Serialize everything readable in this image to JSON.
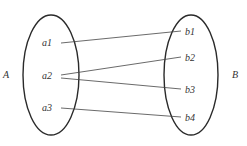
{
  "diagram": {
    "type": "mapping",
    "sets": [
      {
        "name": "A",
        "elements": [
          "a1",
          "a2",
          "a3"
        ]
      },
      {
        "name": "B",
        "elements": [
          "b1",
          "b2",
          "b3",
          "b4"
        ]
      }
    ],
    "set_labels": {
      "A": "A",
      "B": "B"
    },
    "elements": {
      "a1": "a1",
      "a2": "a2",
      "a3": "a3",
      "b1": "b1",
      "b2": "b2",
      "b3": "b3",
      "b4": "b4"
    },
    "mappings": [
      {
        "from": "a1",
        "to": "b1"
      },
      {
        "from": "a2",
        "to": "b2"
      },
      {
        "from": "a2",
        "to": "b3"
      },
      {
        "from": "a3",
        "to": "b4"
      }
    ],
    "colors": {
      "stroke": "#2a2a2a",
      "text": "#333333",
      "background": "#ffffff"
    }
  }
}
